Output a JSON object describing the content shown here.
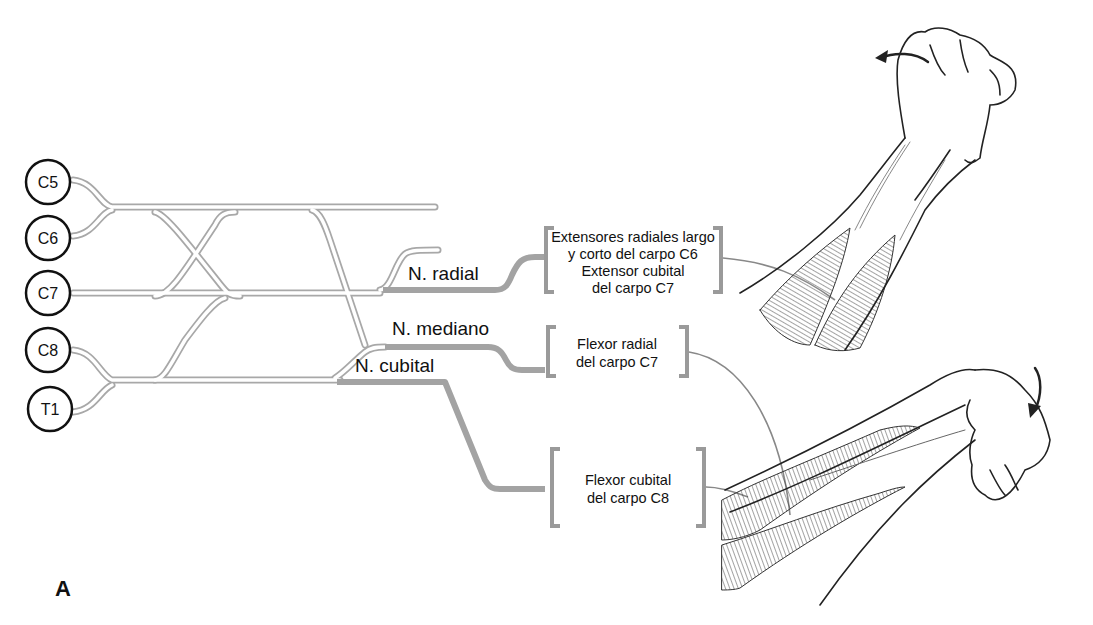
{
  "figure": {
    "panel_label": "A",
    "colors": {
      "plexus_outline": "#a8a8a8",
      "nerve_trunk": "#a0a0a0",
      "bracket": "#9a9a9a",
      "root_circle": "#111111",
      "arm_line": "#222222"
    }
  },
  "roots": [
    {
      "label": "C5"
    },
    {
      "label": "C6"
    },
    {
      "label": "C7"
    },
    {
      "label": "C8"
    },
    {
      "label": "T1"
    }
  ],
  "nerves": [
    {
      "label": "N. radial"
    },
    {
      "label": "N. mediano"
    },
    {
      "label": "N. cubital"
    }
  ],
  "muscles": [
    {
      "lines": [
        "Extensores radiales largo",
        "y corto del carpo C6",
        "Extensor cubital",
        "del carpo C7"
      ]
    },
    {
      "lines": [
        "Flexor radial",
        "del carpo C7"
      ]
    },
    {
      "lines": [
        "Flexor cubital",
        "del carpo C8"
      ]
    }
  ],
  "illustrations": [
    {
      "name": "wrist-extension-arm",
      "arrow": "arrow-left-curved"
    },
    {
      "name": "wrist-flexion-arm",
      "arrow": "arrow-down-curved"
    }
  ]
}
